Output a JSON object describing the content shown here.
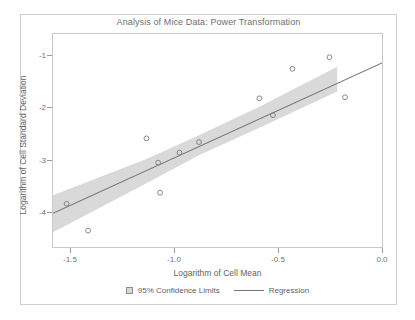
{
  "chart_data": {
    "type": "scatter",
    "title": "Analysis of Mice Data: Power Transformation",
    "xlabel": "Logarithm of Cell Mean",
    "ylabel": "Logarithm of Cell Standard Deviation",
    "xlim": [
      -1.63,
      0.06
    ],
    "ylim": [
      -4.66,
      -0.62
    ],
    "grid": false,
    "legend_position": "bottom",
    "xticks": [
      -1.5,
      -1.0,
      -0.5,
      0.0
    ],
    "xtick_labels": [
      "-1.5",
      "-1.0",
      "-0.5",
      "0.0"
    ],
    "yticks": [
      -1,
      -2,
      -3,
      -4
    ],
    "ytick_labels": [
      "-1",
      "-2",
      "-3",
      "-4"
    ],
    "series": [
      {
        "name": "Observations",
        "type": "scatter",
        "marker": "open-circle",
        "color": "#7a7a85",
        "points": [
          {
            "x": -1.56,
            "y": -3.84
          },
          {
            "x": -1.45,
            "y": -4.35
          },
          {
            "x": -1.15,
            "y": -2.6
          },
          {
            "x": -1.09,
            "y": -3.06
          },
          {
            "x": -1.08,
            "y": -3.63
          },
          {
            "x": -0.98,
            "y": -2.87
          },
          {
            "x": -0.88,
            "y": -2.67
          },
          {
            "x": -0.57,
            "y": -1.84
          },
          {
            "x": -0.5,
            "y": -2.16
          },
          {
            "x": -0.4,
            "y": -1.28
          },
          {
            "x": -0.21,
            "y": -1.06
          },
          {
            "x": -0.13,
            "y": -1.82
          }
        ]
      },
      {
        "name": "Regression",
        "type": "line",
        "color": "#75757f",
        "x": [
          -1.63,
          0.06
        ],
        "y": [
          -4.02,
          -1.17
        ],
        "slope": 1.806,
        "intercept": -1.065
      },
      {
        "name": "95% Confidence Limits",
        "type": "band",
        "color": "#d9d9d9",
        "x": [
          -1.63,
          -1.15,
          -0.88,
          -0.57,
          -0.17
        ],
        "lower": [
          -4.38,
          -3.45,
          -2.92,
          -2.4,
          -1.71
        ],
        "upper": [
          -3.68,
          -2.99,
          -2.54,
          -2.0,
          -1.24
        ]
      }
    ]
  },
  "legend": {
    "items": [
      {
        "label": "95% Confidence Limits",
        "swatch": "band"
      },
      {
        "label": "Regression",
        "swatch": "line"
      }
    ]
  }
}
